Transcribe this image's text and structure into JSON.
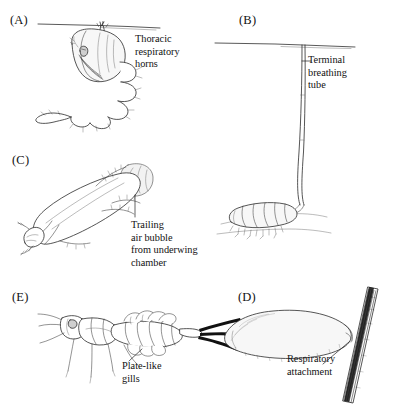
{
  "figure": {
    "background_color": "#ffffff",
    "ink_color": "#2b2b2b",
    "panel_count": 5
  },
  "panels": [
    {
      "id": "A",
      "label": "(A)",
      "subject": "mosquito-pupa",
      "callout": "Thoracic\nrespiratory\nhorns",
      "has_water_surface_line": true,
      "leader": "vertical-short"
    },
    {
      "id": "B",
      "label": "(B)",
      "subject": "rat-tailed-maggot",
      "callout": "Terminal\nbreathing\ntube",
      "has_water_surface_line": true,
      "leader": "horizontal-tick"
    },
    {
      "id": "C",
      "label": "(C)",
      "subject": "diving-beetle",
      "callout": "Trailing\nair bubble\nfrom underwing\nchamber",
      "has_water_surface_line": false,
      "leader": "vertical-short"
    },
    {
      "id": "D",
      "label": "(D)",
      "subject": "larva-on-plant-stem",
      "callout": "Respiratory\nattachment",
      "has_water_surface_line": false,
      "leader": "diagonal"
    },
    {
      "id": "E",
      "label": "(E)",
      "subject": "mayfly-nymph",
      "callout": "Plate-like\ngills",
      "has_water_surface_line": false,
      "leader": "diagonal"
    }
  ]
}
